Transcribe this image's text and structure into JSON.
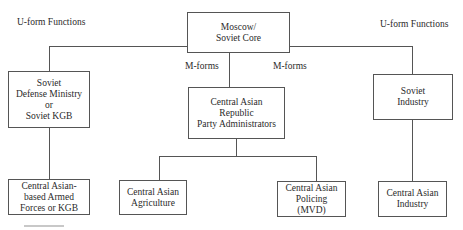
{
  "diagram": {
    "labels": {
      "uform_left": "U-form Functions",
      "uform_right": "U-form Functions",
      "mforms_left": "M-forms",
      "mforms_right": "M-forms"
    },
    "nodes": {
      "moscow": {
        "lines": [
          "Moscow/",
          "Soviet Core"
        ]
      },
      "defense": {
        "lines": [
          "Soviet",
          "Defense Ministry",
          "or",
          "Soviet KGB"
        ]
      },
      "republic": {
        "lines": [
          "Central Asian",
          "Republic",
          "Party Administrators"
        ]
      },
      "industry": {
        "lines": [
          "Soviet",
          "Industry"
        ]
      },
      "armed": {
        "lines": [
          "Central Asian-",
          "based Armed",
          "Forces or KGB"
        ]
      },
      "agriculture": {
        "lines": [
          "Central Asian",
          "Agriculture"
        ]
      },
      "policing": {
        "lines": [
          "Central Asian",
          "Policing",
          "(MVD)"
        ]
      },
      "ca_industry": {
        "lines": [
          "Central Asian",
          "Industry"
        ]
      }
    },
    "edges": [
      [
        "moscow",
        "defense"
      ],
      [
        "moscow",
        "republic"
      ],
      [
        "moscow",
        "industry"
      ],
      [
        "defense",
        "armed"
      ],
      [
        "republic",
        "agriculture"
      ],
      [
        "republic",
        "policing"
      ],
      [
        "industry",
        "ca_industry"
      ]
    ]
  }
}
